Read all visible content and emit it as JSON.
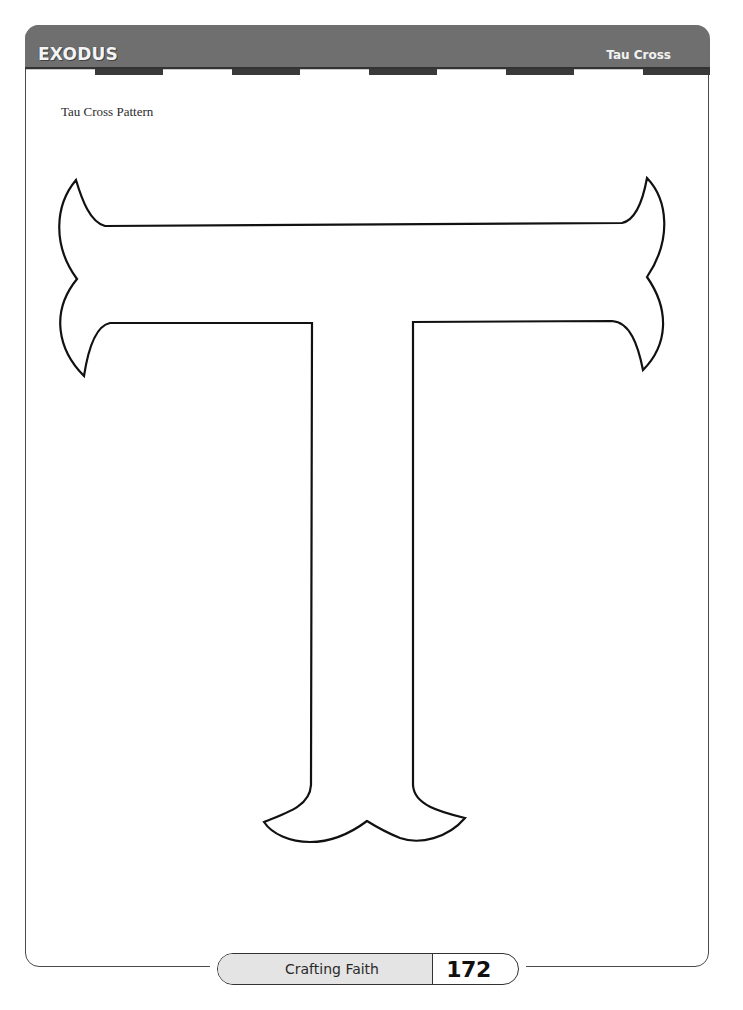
{
  "header": {
    "title": "EXODUS",
    "section": "Tau Cross",
    "band_color": "#6f6f6f",
    "stripe_pattern": [
      "w",
      "d",
      "w",
      "d",
      "w",
      "d",
      "w",
      "d",
      "w",
      "d"
    ]
  },
  "content": {
    "pattern_title": "Tau Cross Pattern",
    "figure": "tau-cross-outline"
  },
  "footer": {
    "book_title": "Crafting Faith",
    "page_number": "172"
  }
}
